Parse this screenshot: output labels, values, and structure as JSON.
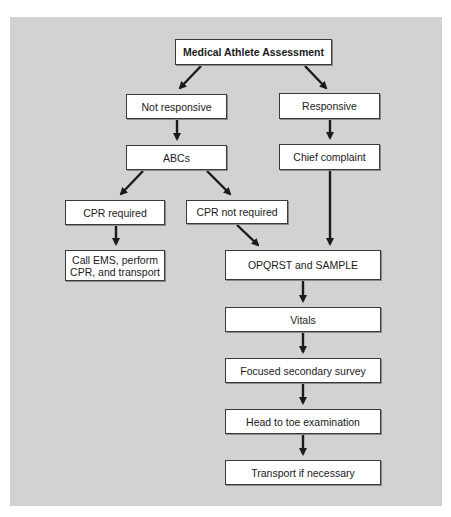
{
  "diagram": {
    "title": "Medical Athlete Assessment",
    "colors": {
      "background": "#d2d2d2",
      "box_fill": "#ffffff",
      "box_border": "#3a3a3a",
      "arrow": "#1a1a1a"
    },
    "nodes": {
      "root": "Medical Athlete Assessment",
      "not_responsive": "Not responsive",
      "responsive": "Responsive",
      "abcs": "ABCs",
      "chief_complaint": "Chief complaint",
      "cpr_required": "CPR required",
      "cpr_not_required": "CPR not required",
      "call_ems_line1": "Call EMS, perform",
      "call_ems_line2": "CPR, and transport",
      "opqrst_sample": "OPQRST and SAMPLE",
      "vitals": "Vitals",
      "focused_secondary_survey": "Focused secondary survey",
      "head_to_toe": "Head to toe examination",
      "transport": "Transport if necessary"
    },
    "edges": [
      {
        "from": "Medical Athlete Assessment",
        "to": "Not responsive"
      },
      {
        "from": "Medical Athlete Assessment",
        "to": "Responsive"
      },
      {
        "from": "Not responsive",
        "to": "ABCs"
      },
      {
        "from": "Responsive",
        "to": "Chief complaint"
      },
      {
        "from": "ABCs",
        "to": "CPR required"
      },
      {
        "from": "ABCs",
        "to": "CPR not required"
      },
      {
        "from": "CPR required",
        "to": "Call EMS, perform CPR, and transport"
      },
      {
        "from": "CPR not required",
        "to": "OPQRST and SAMPLE"
      },
      {
        "from": "Chief complaint",
        "to": "OPQRST and SAMPLE"
      },
      {
        "from": "OPQRST and SAMPLE",
        "to": "Vitals"
      },
      {
        "from": "Vitals",
        "to": "Focused secondary survey"
      },
      {
        "from": "Focused secondary survey",
        "to": "Head to toe examination"
      },
      {
        "from": "Head to toe examination",
        "to": "Transport if necessary"
      }
    ]
  }
}
